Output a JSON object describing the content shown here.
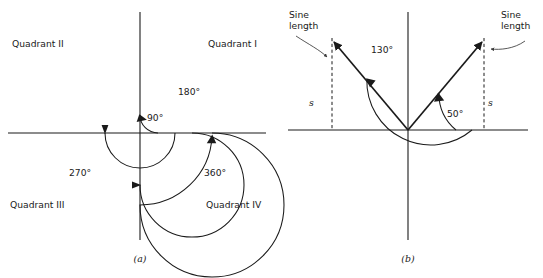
{
  "figure": {
    "background_color": "#ffffff",
    "ink_color": "#1a1a1a",
    "leader_color": "#3a3a3a",
    "width": 543,
    "height": 278
  },
  "panel_a": {
    "caption": "(a)",
    "origin": {
      "x": 140,
      "y": 133
    },
    "axes": {
      "x_label": "",
      "y_label": "",
      "x_extent": [
        8,
        266
      ],
      "y_extent": [
        12,
        240
      ]
    },
    "quadrants": [
      {
        "id": "quadrant-1",
        "label": "Quadrant I",
        "x": 208,
        "y": 47
      },
      {
        "id": "quadrant-2",
        "label": "Quadrant II",
        "x": 12,
        "y": 47
      },
      {
        "id": "quadrant-3",
        "label": "Quadrant III",
        "x": 10,
        "y": 208
      },
      {
        "id": "quadrant-4",
        "label": "Quadrant IV",
        "x": 206,
        "y": 208
      }
    ],
    "angle_arcs": [
      {
        "id": "arc-90",
        "label": "90°",
        "radius": 18,
        "sweep_degrees": 90,
        "label_x": 147,
        "label_y": 121,
        "arrow_at": "positive-y-axis",
        "arrow_direction": "counterclockwise"
      },
      {
        "id": "arc-180",
        "label": "180°",
        "radius": 35,
        "sweep_degrees": 180,
        "label_x": 178,
        "label_y": 95,
        "arrow_at": "negative-x-axis",
        "arrow_direction": "counterclockwise"
      },
      {
        "id": "arc-270",
        "label": "270°",
        "radius": 52,
        "sweep_degrees": 270,
        "label_x": 69,
        "label_y": 176,
        "arrow_at": "negative-y-axis",
        "arrow_direction": "counterclockwise"
      },
      {
        "id": "arc-360",
        "label": "360°",
        "radius": 72,
        "sweep_degrees": 360,
        "label_x": 204,
        "label_y": 176,
        "arrow_at": "positive-x-axis",
        "arrow_direction": "counterclockwise"
      }
    ]
  },
  "panel_b": {
    "caption": "(b)",
    "origin": {
      "x": 408,
      "y": 130
    },
    "axes": {
      "x_extent": [
        288,
        528
      ],
      "y_extent": [
        12,
        240
      ]
    },
    "rays": [
      {
        "id": "ray-130",
        "angle_degrees": 130,
        "length": 118,
        "tip_x": 332,
        "tip_y": 40
      },
      {
        "id": "ray-50",
        "angle_degrees": 50,
        "length": 118,
        "tip_x": 484,
        "tip_y": 40
      }
    ],
    "angle_arcs": [
      {
        "id": "arc-130",
        "label": "130°",
        "radius": 64,
        "start_degrees": 0,
        "end_degrees": 130,
        "label_x": 371,
        "label_y": 53
      },
      {
        "id": "arc-50",
        "label": "50°",
        "radius": 48,
        "start_degrees": 0,
        "end_degrees": 50,
        "label_x": 447,
        "label_y": 117
      }
    ],
    "sine_annotations": [
      {
        "id": "sine-length-left",
        "label_line1": "Sine",
        "label_line2": "length",
        "label_x": 289,
        "label_y": 21,
        "s_symbol": "s",
        "s_x": 309,
        "s_y": 106,
        "dashed_x": 332,
        "dashed_y_top": 40,
        "dashed_y_bottom": 130
      },
      {
        "id": "sine-length-right",
        "label_line1": "Sine",
        "label_line2": "length",
        "label_x": 497,
        "label_y": 21,
        "s_symbol": "s",
        "s_x": 488,
        "s_y": 106,
        "dashed_x": 484,
        "dashed_y_top": 40,
        "dashed_y_bottom": 130
      }
    ]
  }
}
